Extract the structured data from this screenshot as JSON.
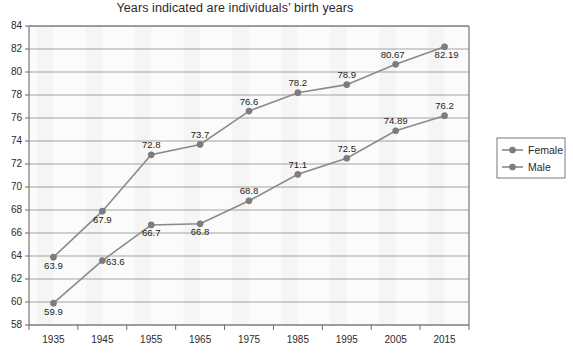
{
  "chart_data": {
    "type": "line",
    "title": "Years indicated are individuals’ birth years",
    "xlabel": "",
    "ylabel": "",
    "categories": [
      "1935",
      "1945",
      "1955",
      "1965",
      "1975",
      "1985",
      "1995",
      "2005",
      "2015"
    ],
    "ylim": [
      58,
      84
    ],
    "ytick_step": 2,
    "yticks": [
      "58",
      "60",
      "62",
      "64",
      "66",
      "68",
      "70",
      "72",
      "74",
      "76",
      "78",
      "80",
      "82",
      "84"
    ],
    "grid": true,
    "legend_position": "right",
    "series": [
      {
        "name": "Female",
        "color": "#7d7d7d",
        "values": [
          63.9,
          67.9,
          72.8,
          73.7,
          76.6,
          78.2,
          78.9,
          80.67,
          82.19
        ],
        "labels": [
          "63.9",
          "67.9",
          "72.8",
          "73.7",
          "76.6",
          "78.2",
          "78.9",
          "80.67",
          "82.19"
        ]
      },
      {
        "name": "Male",
        "color": "#7d7d7d",
        "values": [
          59.9,
          63.6,
          66.7,
          66.8,
          68.8,
          71.1,
          72.5,
          74.89,
          76.2
        ],
        "labels": [
          "59.9",
          "63.6",
          "66.7",
          "66.8",
          "68.8",
          "71.1",
          "72.5",
          "74.89",
          "76.2"
        ]
      }
    ]
  },
  "legend": {
    "items": [
      {
        "label": "Female"
      },
      {
        "label": "Male"
      }
    ]
  }
}
